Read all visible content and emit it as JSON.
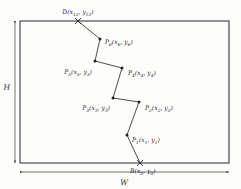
{
  "figure": {
    "type": "geometry-diagram",
    "colors": {
      "stroke": "#3a3a3a",
      "text": "#2b2b2b",
      "background": "#fdfdfc",
      "marker": "#1f1f1f"
    },
    "rectangle": {
      "name": "boundary-rectangle",
      "x": 20,
      "y": 21,
      "width": 209,
      "height": 142
    },
    "dimensions": [
      {
        "name": "height-dimension",
        "label": "H",
        "orientation": "vertical",
        "x": 15,
        "y1": 21,
        "y2": 163,
        "label_x": 11,
        "label_y": 88
      },
      {
        "name": "width-dimension",
        "label": "W",
        "orientation": "horizontal",
        "y": 172,
        "x1": 20,
        "x2": 229,
        "label_x": 124,
        "label_y": 184
      }
    ],
    "points": [
      {
        "id": "D",
        "name": "point-d",
        "label_base": "D",
        "label_x_sub": "12",
        "label_y_sub": "12",
        "label": "D(x12, y12)",
        "x": 78,
        "y": 21,
        "marker": "cross",
        "label_anchor": "middle",
        "label_px": 78,
        "label_py": 13
      },
      {
        "id": "P6",
        "name": "point-p6",
        "label_base": "P",
        "label_x_sub": "6",
        "label_y_sub": "6",
        "label": "P6(x6, y6)",
        "x": 100,
        "y": 39,
        "marker": "dot",
        "label_anchor": "start",
        "label_px": 105,
        "label_py": 43
      },
      {
        "id": "P5",
        "name": "point-p5",
        "label_base": "P",
        "label_x_sub": "5",
        "label_y_sub": "5",
        "label": "P5(x5, y5)",
        "x": 95,
        "y": 61,
        "marker": "dot",
        "label_anchor": "end",
        "label_px": 92,
        "label_py": 73
      },
      {
        "id": "P4",
        "name": "point-p4",
        "label_base": "P",
        "label_x_sub": "4",
        "label_y_sub": "4",
        "label": "P4(x4, y4)",
        "x": 122,
        "y": 68,
        "marker": "dot",
        "label_anchor": "start",
        "label_px": 128,
        "label_py": 74
      },
      {
        "id": "P3",
        "name": "point-p3",
        "label_base": "P",
        "label_x_sub": "3",
        "label_y_sub": "3",
        "label": "P3(x3, y3)",
        "x": 113,
        "y": 98,
        "marker": "dot",
        "label_anchor": "end",
        "label_px": 110,
        "label_py": 109
      },
      {
        "id": "P2",
        "name": "point-p2",
        "label_base": "P",
        "label_x_sub": "2",
        "label_y_sub": "2",
        "label": "P2(x2, y2)",
        "x": 139,
        "y": 102,
        "marker": "dot",
        "label_anchor": "start",
        "label_px": 145,
        "label_py": 109
      },
      {
        "id": "P1",
        "name": "point-p1",
        "label_base": "P",
        "label_x_sub": "1",
        "label_y_sub": "1",
        "label": "P1(x1, y1)",
        "x": 127,
        "y": 135,
        "marker": "dot",
        "label_anchor": "start",
        "label_px": 132,
        "label_py": 141
      },
      {
        "id": "B",
        "name": "point-b",
        "label_base": "B",
        "label_x_sub": "0",
        "label_y_sub": "0",
        "label": "B(x0, y0)",
        "x": 140,
        "y": 163,
        "marker": "cross",
        "label_anchor": "start",
        "label_px": 130,
        "label_py": 172
      }
    ],
    "polyline": "78,21 100,39 95,61 122,68 113,98 139,102 127,135 140,163"
  }
}
